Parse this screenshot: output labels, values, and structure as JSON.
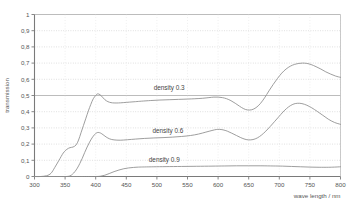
{
  "chart_data": {
    "type": "line",
    "title": "",
    "xlabel": "wave length / nm",
    "ylabel": "transmission",
    "xlim": [
      300,
      800
    ],
    "ylim": [
      0,
      1
    ],
    "grid": true,
    "grid_axis": "y",
    "legend_position": "inline-annotations",
    "xticks": [
      300,
      350,
      400,
      450,
      500,
      550,
      600,
      650,
      700,
      750,
      800
    ],
    "xticklabels": [
      "300",
      "350",
      "400",
      "450",
      "500",
      "550",
      "600",
      "650",
      "700",
      "750",
      "800"
    ],
    "yticks": [
      0,
      0.1,
      0.2,
      0.3,
      0.4,
      0.5,
      0.6,
      0.7,
      0.8,
      0.9,
      1
    ],
    "yticklabels": [
      "0",
      "0,1",
      "0,2",
      "0,3",
      "0,4",
      "0,5",
      "0,6",
      "0,7",
      "0,8",
      "0,9",
      "1"
    ],
    "line_color": "#8c8c8c",
    "grid_color": "#c9c9c9",
    "axis_color": "#7a7a7a",
    "series": [
      {
        "name": "density 0.3",
        "label": "density 0.3",
        "label_x": 520,
        "label_y": 0.535,
        "x": [
          300,
          310,
          320,
          327,
          333,
          340,
          347,
          353,
          358,
          363,
          368,
          372,
          376,
          380,
          384,
          388,
          392,
          396,
          400,
          403,
          407,
          411,
          415,
          420,
          425,
          430,
          437,
          445,
          455,
          465,
          475,
          490,
          505,
          520,
          535,
          550,
          562,
          575,
          585,
          593,
          600,
          607,
          614,
          621,
          628,
          635,
          642,
          648,
          655,
          662,
          669,
          676,
          683,
          690,
          697,
          704,
          711,
          718,
          725,
          732,
          738,
          745,
          752,
          760,
          768,
          776,
          784,
          792,
          800
        ],
        "y": [
          0.0,
          0.0,
          0.005,
          0.02,
          0.055,
          0.1,
          0.145,
          0.168,
          0.178,
          0.182,
          0.195,
          0.225,
          0.27,
          0.315,
          0.36,
          0.405,
          0.445,
          0.48,
          0.5,
          0.51,
          0.505,
          0.49,
          0.474,
          0.462,
          0.456,
          0.454,
          0.454,
          0.456,
          0.459,
          0.462,
          0.465,
          0.469,
          0.472,
          0.474,
          0.476,
          0.478,
          0.48,
          0.483,
          0.487,
          0.49,
          0.49,
          0.487,
          0.48,
          0.468,
          0.452,
          0.434,
          0.418,
          0.411,
          0.412,
          0.425,
          0.45,
          0.486,
          0.528,
          0.568,
          0.605,
          0.638,
          0.663,
          0.681,
          0.692,
          0.698,
          0.7,
          0.698,
          0.691,
          0.678,
          0.663,
          0.646,
          0.632,
          0.62,
          0.612
        ]
      },
      {
        "name": "density 0.6",
        "label": "density 0.6",
        "label_x": 518,
        "label_y": 0.27,
        "x": [
          300,
          320,
          340,
          352,
          358,
          362,
          366,
          370,
          374,
          378,
          382,
          386,
          390,
          394,
          398,
          401,
          404,
          408,
          412,
          417,
          423,
          430,
          440,
          452,
          465,
          480,
          495,
          510,
          525,
          540,
          555,
          568,
          580,
          590,
          597,
          602,
          608,
          615,
          622,
          630,
          637,
          644,
          650,
          657,
          664,
          671,
          678,
          685,
          692,
          699,
          706,
          712,
          718,
          724,
          730,
          737,
          745,
          753,
          762,
          771,
          780,
          790,
          800
        ],
        "y": [
          0.0,
          0.0,
          0.0,
          0.0,
          0.004,
          0.014,
          0.03,
          0.052,
          0.08,
          0.112,
          0.148,
          0.182,
          0.212,
          0.238,
          0.258,
          0.268,
          0.272,
          0.268,
          0.258,
          0.244,
          0.232,
          0.226,
          0.224,
          0.227,
          0.231,
          0.235,
          0.238,
          0.24,
          0.243,
          0.247,
          0.253,
          0.262,
          0.274,
          0.284,
          0.29,
          0.291,
          0.288,
          0.28,
          0.268,
          0.253,
          0.24,
          0.23,
          0.226,
          0.228,
          0.238,
          0.256,
          0.28,
          0.308,
          0.338,
          0.368,
          0.398,
          0.42,
          0.437,
          0.448,
          0.452,
          0.45,
          0.44,
          0.424,
          0.402,
          0.378,
          0.354,
          0.334,
          0.322
        ]
      },
      {
        "name": "density 0.9",
        "label": "density 0.9",
        "label_x": 512,
        "label_y": 0.088,
        "x": [
          300,
          340,
          380,
          400,
          408,
          415,
          422,
          430,
          438,
          446,
          454,
          462,
          470,
          480,
          495,
          515,
          540,
          565,
          590,
          610,
          630,
          650,
          670,
          690,
          705,
          720,
          735,
          750,
          765,
          780,
          790,
          800
        ],
        "y": [
          0.0,
          0.0,
          0.0,
          0.0,
          0.002,
          0.008,
          0.018,
          0.03,
          0.04,
          0.048,
          0.053,
          0.056,
          0.058,
          0.059,
          0.06,
          0.061,
          0.062,
          0.063,
          0.064,
          0.065,
          0.066,
          0.066,
          0.066,
          0.065,
          0.064,
          0.062,
          0.06,
          0.058,
          0.057,
          0.057,
          0.058,
          0.06
        ]
      }
    ]
  },
  "axes": {
    "y_title": "transmission",
    "x_title": "wave length / nm"
  }
}
